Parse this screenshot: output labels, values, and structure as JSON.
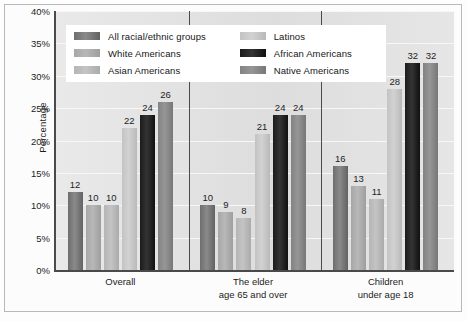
{
  "chart_data": {
    "type": "bar",
    "title": "",
    "xlabel": "",
    "ylabel": "Percentage",
    "ylim": [
      0,
      40
    ],
    "ytick_labels": [
      "0%",
      "5%",
      "10%",
      "15%",
      "20%",
      "25%",
      "30%",
      "35%",
      "40%"
    ],
    "ytick_values": [
      0,
      5,
      10,
      15,
      20,
      25,
      30,
      35,
      40
    ],
    "grid": true,
    "legend_position": "top-center",
    "categories": [
      "Overall",
      "The elder\nage 65 and over",
      "Children\nunder age 18"
    ],
    "category_lines": [
      [
        "Overall"
      ],
      [
        "The elder",
        "age 65 and over"
      ],
      [
        "Children",
        "under age 18"
      ]
    ],
    "series": [
      {
        "name": "All racial/ethnic groups",
        "color": "#7a7a7a",
        "values": [
          12,
          10,
          16
        ]
      },
      {
        "name": "White Americans",
        "color": "#b0b0b0",
        "values": [
          10,
          9,
          13
        ]
      },
      {
        "name": "Asian Americans",
        "color": "#bdbdbd",
        "values": [
          10,
          8,
          11
        ]
      },
      {
        "name": "Latinos",
        "color": "#cbcbcb",
        "values": [
          22,
          21,
          28
        ]
      },
      {
        "name": "African Americans",
        "color": "#1d1d1d",
        "values": [
          24,
          24,
          32
        ]
      },
      {
        "name": "Native Americans",
        "color": "#8c8c8c",
        "values": [
          26,
          24,
          32
        ]
      }
    ]
  },
  "legend": {
    "left_column": [
      "All racial/ethnic groups",
      "White Americans",
      "Asian Americans"
    ],
    "right_column": [
      "Latinos",
      "African Americans",
      "Native Americans"
    ]
  }
}
